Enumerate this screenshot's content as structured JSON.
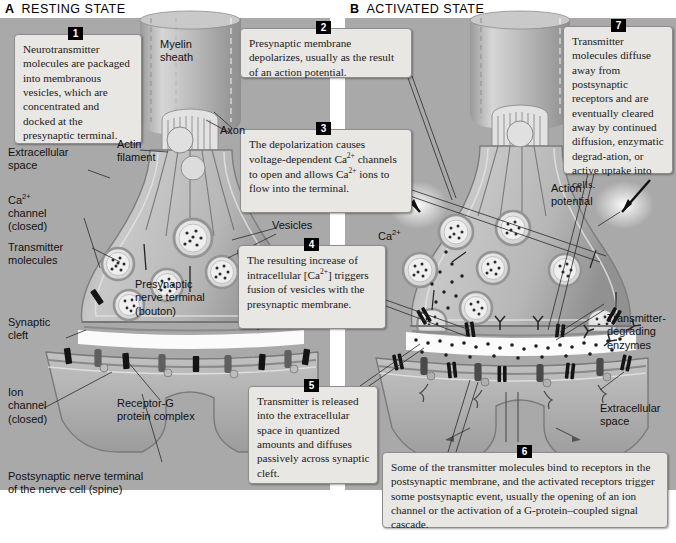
{
  "figure": {
    "panelA": {
      "letter": "A",
      "title": "RESTING STATE"
    },
    "panelB": {
      "letter": "B",
      "title": "ACTIVATED STATE"
    }
  },
  "callouts": [
    {
      "n": "1",
      "text": "Neurotransmitter molecules are packaged into membranous vesicles, which are concentrated and docked at the presynaptic terminal."
    },
    {
      "n": "2",
      "text": "Presynaptic membrane depolarizes, usually as the result of an action potential."
    },
    {
      "n": "3",
      "text": "The depolarization causes voltage-dependent Ca2+ channels to open and allows Ca2+ ions to flow into the terminal."
    },
    {
      "n": "4",
      "text": "The resulting increase of intracellular [Ca2+] triggers fusion of vesicles with the presynaptic membrane."
    },
    {
      "n": "5",
      "text": "Transmitter is released into the extracellular space in quantized amounts and diffuses passively across synaptic cleft."
    },
    {
      "n": "6",
      "text": "Some of the transmitter molecules bind to receptors in the postsynaptic membrane, and the activated receptors trigger some postsynaptic event, usually the opening of an ion channel or the activation of a G-protein–coupled signal cascade."
    },
    {
      "n": "7",
      "text": "Transmitter molecules diffuse away from postsynaptic receptors and are eventually cleared away by continued diffusion, enzymatic degrad-ation, or active uptake into cells."
    }
  ],
  "labels": {
    "myelin_sheath": "Myelin\nsheath",
    "axon": "Axon",
    "actin_filament": "Actin\nfilament",
    "extracellular_space_a": "Extracellular\nspace",
    "ca_channel_closed": "Ca2+\nchannel\n(closed)",
    "transmitter_molecules": "Transmitter\nmolecules",
    "vesicles": "Vesicles",
    "presynaptic_terminal": "Presynaptic\nnerve terminal\n(bouton)",
    "synaptic_cleft": "Synaptic\ncleft",
    "ion_channel_closed": "Ion\nchannel\n(closed)",
    "receptor_g_complex": "Receptor-G\nprotein complex",
    "postsynaptic_terminal": "Postsynaptic nerve terminal\nof the nerve cell (spine)",
    "ca_label_a": "Ca2+",
    "ca_label_b": "Ca2+",
    "action_potential": "Action\npotential",
    "transmitter_degrading_enzymes": "Transmitter-\ndegrading\nenzymes",
    "extracellular_space_b": "Extracellular\nspace"
  },
  "colors": {
    "panel_background": "#a9a9a9",
    "callout_background": "#e8e7e3",
    "badge_background": "#000000",
    "neuron_fill": "#b4b4b4",
    "membrane": "#8a8a8a",
    "vesicle_fill": "#dcdcdc",
    "channel_dark": "#1c1c1c",
    "cleft_white": "#fafafa"
  }
}
